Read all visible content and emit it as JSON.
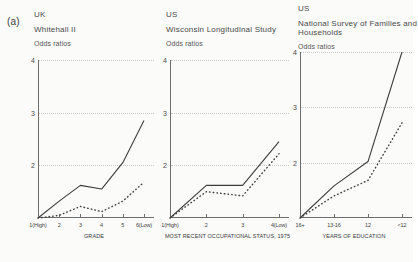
{
  "figure": {
    "panel_letter": "(a)",
    "y_axis_label": "Odds ratios",
    "y_ticks": [
      "4",
      "3",
      "2"
    ],
    "ylim": [
      1,
      4
    ]
  },
  "chart_data": [
    {
      "type": "line",
      "title": "Whitehall II",
      "country": "UK",
      "ylabel": "Odds ratios",
      "xlabel": "GRADE",
      "categories": [
        "1(High)",
        "2",
        "3",
        "4",
        "5",
        "6(Low)"
      ],
      "ylim": [
        1,
        4
      ],
      "xlim": [
        1,
        6
      ],
      "grid": true,
      "gridlines": [
        2,
        3,
        4
      ],
      "series": [
        {
          "name": "solid",
          "style": "solid",
          "values": [
            1.0,
            1.32,
            1.62,
            1.55,
            2.05,
            2.85
          ]
        },
        {
          "name": "dotted",
          "style": "dotted",
          "values": [
            1.0,
            1.05,
            1.22,
            1.12,
            1.32,
            1.68
          ]
        }
      ]
    },
    {
      "type": "line",
      "title": "Wisconsin Longitudinal Study",
      "country": "US",
      "ylabel": "Odds ratios",
      "xlabel": "MOST RECENT OCCUPATIONAL STATUS, 1975",
      "categories": [
        "1(High)",
        "2",
        "3",
        "4(Low)"
      ],
      "ylim": [
        1,
        4
      ],
      "xlim": [
        1,
        4
      ],
      "grid": true,
      "gridlines": [
        2,
        3,
        4
      ],
      "series": [
        {
          "name": "solid",
          "style": "solid",
          "values": [
            1.0,
            1.62,
            1.62,
            2.45
          ]
        },
        {
          "name": "dotted",
          "style": "dotted",
          "values": [
            1.0,
            1.5,
            1.42,
            2.22
          ]
        }
      ]
    },
    {
      "type": "line",
      "title": "National Survey of Families and Households",
      "country": "US",
      "ylabel": "Odds ratios",
      "xlabel": "YEARS OF EDUCATION",
      "categories": [
        "16+",
        "13-16",
        "12",
        "<12"
      ],
      "ylim": [
        1,
        4
      ],
      "xlim": [
        1,
        4
      ],
      "grid": true,
      "gridlines": [
        2,
        3,
        4
      ],
      "series": [
        {
          "name": "solid",
          "style": "solid",
          "values": [
            1.0,
            1.58,
            2.02,
            4.0
          ]
        },
        {
          "name": "dotted",
          "style": "dotted",
          "values": [
            1.0,
            1.4,
            1.68,
            2.72
          ]
        }
      ]
    }
  ]
}
